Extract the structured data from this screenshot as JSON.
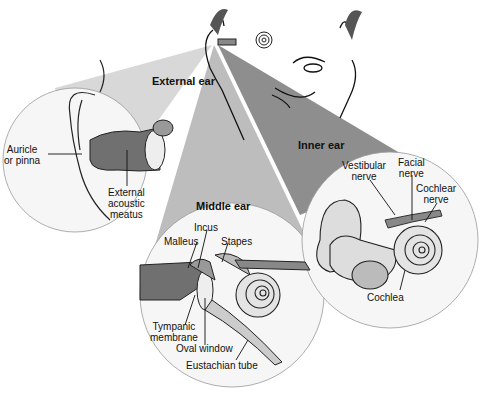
{
  "diagram": {
    "sections": {
      "external": "External ear",
      "middle": "Middle ear",
      "inner": "Inner ear"
    },
    "labels": {
      "auricle_1": "Auricle",
      "auricle_2": "or pinna",
      "eam_1": "External",
      "eam_2": "acoustic",
      "eam_3": "meatus",
      "incus": "Incus",
      "malleus": "Malleus",
      "stapes": "Stapes",
      "tympanic_1": "Tympanic",
      "tympanic_2": "membrane",
      "oval_window": "Oval window",
      "eustachian": "Eustachian tube",
      "vestibular_1": "Vestibular",
      "vestibular_2": "nerve",
      "facial_1": "Facial",
      "facial_2": "nerve",
      "cochlear_1": "Cochlear",
      "cochlear_2": "nerve",
      "cochlea": "Cochlea"
    },
    "colors": {
      "wedge_external": "#d4d4d4",
      "wedge_middle": "#b8b8b8",
      "wedge_inner": "#8f8f8f",
      "circle_fill": "#f7f7f7",
      "canal": "#6e6e6e"
    }
  }
}
